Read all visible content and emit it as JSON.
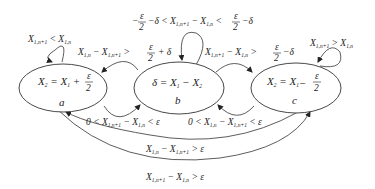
{
  "diagram": {
    "type": "state-transition-diagram",
    "states": [
      {
        "id": "a",
        "name": "a",
        "equation": "X₂ = X₁ + ε/2",
        "eq_lhs": "X",
        "eq_lhs_sub": "2",
        "eq_mid": "= X",
        "eq_mid_sub": "1",
        "eq_op": "+",
        "frac_num": "ε",
        "frac_den": "2"
      },
      {
        "id": "b",
        "name": "b",
        "equation": "δ = X₁ − X₂",
        "eq_text": "δ = X",
        "eq_sub1": "1",
        "eq_minus": "− X",
        "eq_sub2": "2"
      },
      {
        "id": "c",
        "name": "c",
        "equation": "X₂ = X₁ − ε/2",
        "eq_lhs": "X",
        "eq_lhs_sub": "2",
        "eq_mid": "= X",
        "eq_mid_sub": "1",
        "eq_op": "−",
        "frac_num": "ε",
        "frac_den": "2"
      }
    ],
    "transitions": [
      {
        "from": "a",
        "to": "a",
        "label": "X₁,ₙ₊₁ < X₁,ₙ"
      },
      {
        "from": "b",
        "to": "b",
        "label": "−ε/2 − δ < X₁,ₙ₊₁ − X₁,ₙ < ε/2 − δ"
      },
      {
        "from": "c",
        "to": "c",
        "label": "X₁,ₙ₊₁ > X₁,ₙ"
      },
      {
        "from": "b",
        "to": "a",
        "label": "X₁,ₙ − X₁,ₙ₊₁ > ε/2 + δ"
      },
      {
        "from": "b",
        "to": "c",
        "label": "X₁,ₙ₊₁ − X₁,ₙ > ε/2 − δ"
      },
      {
        "from": "a",
        "to": "b",
        "label": "0 < X₁,ₙ₊₁ − X₁,ₙ < ε"
      },
      {
        "from": "c",
        "to": "b",
        "label": "0 < X₁,ₙ − X₁,ₙ₊₁ < ε"
      },
      {
        "from": "c",
        "to": "a",
        "label": "X₁,ₙ − X₁,ₙ₊₁ > ε"
      },
      {
        "from": "a",
        "to": "c",
        "label": "X₁,ₙ₊₁ − X₁,ₙ > ε"
      }
    ]
  },
  "tokens": {
    "X": "X",
    "sub_n1": "1,n+1",
    "sub_n": "1,n",
    "lt": "<",
    "gt": ">",
    "minus": "−",
    "plus": "+",
    "eps": "ε",
    "delta": "δ",
    "two": "2",
    "zero": "0",
    "neg_eps": "−"
  }
}
